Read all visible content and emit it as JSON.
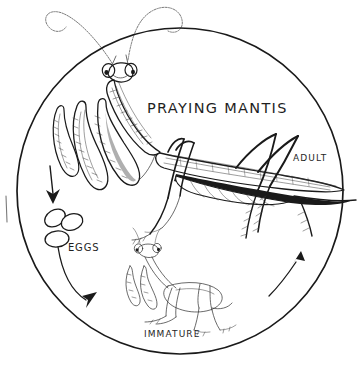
{
  "figure": {
    "kind": "scientific-illustration",
    "title": "PRAYING MANTIS",
    "frame": {
      "shape": "circle",
      "center_x": 180,
      "center_y": 191,
      "radius": 163,
      "stroke": "#1a1a1a"
    },
    "background_color": "#ffffff",
    "ink_color": "#1a1a1a"
  },
  "labels": {
    "title": "PRAYING MANTIS",
    "adult": "ADULT",
    "eggs": "EGGS",
    "immature": "IMMATURE"
  },
  "stages": [
    {
      "id": "adult",
      "label": "ADULT",
      "position": "upper",
      "notes": "winged adult mantis with raptorial forelegs and long antennae"
    },
    {
      "id": "eggs",
      "label": "EGGS",
      "position": "left",
      "notes": "cluster of three oval eggs"
    },
    {
      "id": "immature",
      "label": "IMMATURE",
      "position": "lower-center",
      "notes": "wingless nymph"
    }
  ],
  "arrows": [
    {
      "id": "adult-to-eggs",
      "from": "adult",
      "to": "eggs",
      "direction": "down",
      "style": "straight"
    },
    {
      "id": "eggs-to-immature",
      "from": "eggs",
      "to": "immature",
      "direction": "down-right",
      "style": "curved"
    },
    {
      "id": "immature-to-adult",
      "from": "immature",
      "to": "adult",
      "direction": "up-right",
      "style": "curved"
    }
  ],
  "colors": {
    "ink": "#1a1a1a",
    "hairline": "#7a7a7a",
    "paper": "#ffffff"
  }
}
